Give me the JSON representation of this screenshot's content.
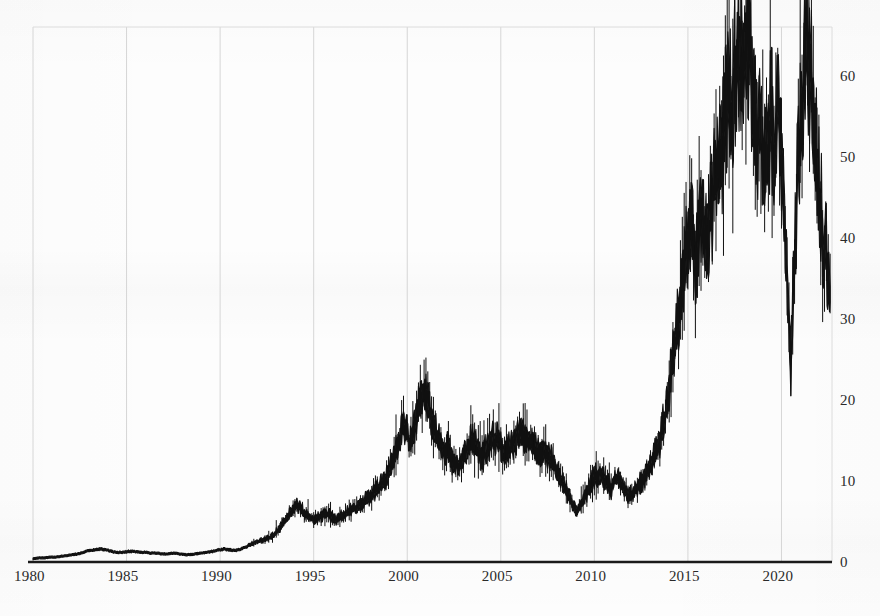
{
  "chart_data": {
    "type": "line",
    "title": "",
    "subtitle": "",
    "xlabel": "",
    "ylabel": "",
    "grid": "vertical-only",
    "legend": "none",
    "xlim": [
      1980,
      2022.7
    ],
    "ylim": [
      0,
      66
    ],
    "x_tick_labels": [
      "1980",
      "1985",
      "1990",
      "1995",
      "2000",
      "2005",
      "2010",
      "2015",
      "2020"
    ],
    "x_tick_values": [
      1980,
      1985,
      1990,
      1995,
      2000,
      2005,
      2010,
      2015,
      2020
    ],
    "y_tick_labels": [
      "0",
      "10",
      "20",
      "30",
      "40",
      "50",
      "60"
    ],
    "y_tick_values": [
      0,
      10,
      20,
      30,
      40,
      50,
      60
    ],
    "y_axis_side": "right",
    "series": [
      {
        "name": "value",
        "color": "#111111",
        "x": [
          1980.0,
          1980.3,
          1980.6,
          1980.9,
          1981.2,
          1981.5,
          1981.8,
          1982.1,
          1982.4,
          1982.7,
          1983.0,
          1983.3,
          1983.6,
          1983.9,
          1984.2,
          1984.5,
          1984.8,
          1985.1,
          1985.4,
          1985.7,
          1986.0,
          1986.3,
          1986.6,
          1986.9,
          1987.2,
          1987.5,
          1987.8,
          1988.1,
          1988.4,
          1988.7,
          1989.0,
          1989.3,
          1989.6,
          1989.9,
          1990.2,
          1990.5,
          1990.8,
          1991.1,
          1991.4,
          1991.7,
          1992.0,
          1992.3,
          1992.6,
          1992.9,
          1993.2,
          1993.5,
          1993.8,
          1994.1,
          1994.4,
          1994.7,
          1995.0,
          1995.3,
          1995.6,
          1995.9,
          1996.2,
          1996.5,
          1996.8,
          1997.1,
          1997.4,
          1997.7,
          1998.0,
          1998.3,
          1998.6,
          1998.9,
          1999.2,
          1999.5,
          1999.8,
          2000.1,
          2000.4,
          2000.7,
          2001.0,
          2001.3,
          2001.6,
          2001.9,
          2002.2,
          2002.5,
          2002.8,
          2003.1,
          2003.4,
          2003.7,
          2004.0,
          2004.3,
          2004.6,
          2004.9,
          2005.2,
          2005.5,
          2005.8,
          2006.1,
          2006.4,
          2006.7,
          2007.0,
          2007.3,
          2007.6,
          2007.9,
          2008.2,
          2008.5,
          2008.8,
          2009.1,
          2009.4,
          2009.7,
          2010.0,
          2010.3,
          2010.6,
          2010.9,
          2011.2,
          2011.5,
          2011.8,
          2012.1,
          2012.4,
          2012.7,
          2013.0,
          2013.3,
          2013.6,
          2013.9,
          2014.2,
          2014.5,
          2014.8,
          2015.1,
          2015.4,
          2015.7,
          2016.0,
          2016.3,
          2016.6,
          2016.9,
          2017.2,
          2017.5,
          2017.8,
          2018.1,
          2018.4,
          2018.7,
          2019.0,
          2019.3,
          2019.6,
          2019.9,
          2020.2,
          2020.5,
          2020.8,
          2021.1,
          2021.4,
          2021.7,
          2022.0,
          2022.3,
          2022.6
        ],
        "y": [
          0.4,
          0.5,
          0.5,
          0.6,
          0.6,
          0.7,
          0.8,
          0.9,
          1.0,
          1.2,
          1.4,
          1.5,
          1.6,
          1.5,
          1.3,
          1.2,
          1.2,
          1.3,
          1.3,
          1.2,
          1.2,
          1.1,
          1.1,
          1.0,
          1.0,
          1.1,
          1.0,
          0.9,
          0.9,
          1.0,
          1.1,
          1.2,
          1.3,
          1.5,
          1.6,
          1.5,
          1.4,
          1.6,
          1.9,
          2.2,
          2.5,
          2.7,
          3.0,
          3.4,
          4.2,
          5.2,
          6.3,
          7.1,
          6.4,
          5.6,
          5.2,
          5.5,
          6.1,
          5.7,
          5.3,
          5.6,
          6.2,
          6.5,
          6.9,
          7.5,
          8.1,
          8.8,
          9.6,
          10.5,
          12.0,
          14.5,
          17.0,
          15.2,
          16.8,
          19.8,
          21.0,
          18.0,
          15.5,
          14.0,
          13.8,
          12.0,
          11.5,
          13.5,
          15.0,
          14.2,
          13.0,
          14.0,
          15.5,
          14.8,
          13.5,
          14.2,
          15.2,
          16.3,
          15.4,
          14.2,
          13.2,
          13.8,
          13.0,
          12.0,
          10.5,
          9.0,
          7.2,
          6.2,
          7.5,
          9.2,
          10.5,
          11.0,
          10.0,
          9.2,
          10.5,
          9.6,
          8.2,
          8.5,
          9.5,
          10.5,
          12.0,
          13.5,
          16.0,
          20.0,
          25.0,
          30.5,
          36.0,
          41.5,
          38.0,
          43.0,
          40.0,
          44.5,
          48.0,
          52.0,
          56.0,
          59.5,
          62.0,
          64.0,
          58.0,
          53.0,
          51.0,
          54.0,
          52.0,
          55.0,
          40.0,
          24.0,
          45.0,
          58.0,
          63.0,
          55.0,
          46.0,
          39.0,
          33.0
        ]
      }
    ]
  },
  "axis": {
    "x_ticks": [
      {
        "label": "1980",
        "value": 1980
      },
      {
        "label": "1985",
        "value": 1985
      },
      {
        "label": "1990",
        "value": 1990
      },
      {
        "label": "1995",
        "value": 1995
      },
      {
        "label": "2000",
        "value": 2000
      },
      {
        "label": "2005",
        "value": 2005
      },
      {
        "label": "2010",
        "value": 2010
      },
      {
        "label": "2015",
        "value": 2015
      },
      {
        "label": "2020",
        "value": 2020
      }
    ],
    "y_ticks": [
      {
        "label": "0",
        "value": 0
      },
      {
        "label": "10",
        "value": 10
      },
      {
        "label": "20",
        "value": 20
      },
      {
        "label": "30",
        "value": 30
      },
      {
        "label": "40",
        "value": 40
      },
      {
        "label": "50",
        "value": 50
      },
      {
        "label": "60",
        "value": 60
      }
    ]
  },
  "style": {
    "background_color": "#fdfdfd",
    "series_color": "#111111",
    "gridline_color": "#d6d6d6",
    "frame_color": "#dcdcdc",
    "tick_text_color": "#2a2a2a",
    "baseline_color": "#1a1a1a"
  }
}
